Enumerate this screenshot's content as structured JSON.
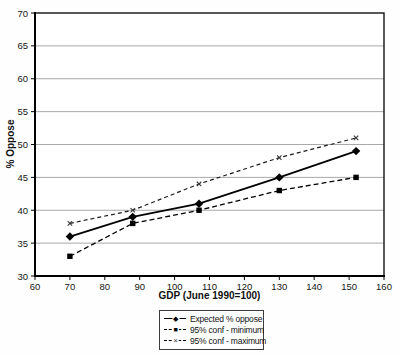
{
  "chart_data": {
    "type": "line",
    "title": "",
    "xlabel": "GDP (June 1990=100)",
    "ylabel": "% Oppose",
    "xlim": [
      60,
      160
    ],
    "ylim": [
      30,
      70
    ],
    "xticks": [
      60,
      70,
      80,
      90,
      100,
      110,
      120,
      130,
      140,
      150,
      160
    ],
    "yticks": [
      30,
      35,
      40,
      45,
      50,
      55,
      60,
      65,
      70
    ],
    "grid": "horizontal",
    "legend_position": "bottom-center",
    "x": [
      70,
      88,
      107,
      130,
      152
    ],
    "series": [
      {
        "name": "Expected % oppose",
        "values": [
          36,
          39,
          41,
          45,
          49
        ],
        "line": "solid",
        "marker": "diamond"
      },
      {
        "name": "95% conf - minimum",
        "values": [
          33,
          38,
          40,
          43,
          45
        ],
        "line": "dashed",
        "marker": "square"
      },
      {
        "name": "95% conf - maximum",
        "values": [
          38,
          40,
          44,
          48,
          51
        ],
        "line": "dashed",
        "marker": "x"
      }
    ]
  },
  "colors": {
    "line": "#000000",
    "grid": "#a8a8a8",
    "background": "#ffffff",
    "text": "#161616"
  },
  "legend": {
    "marker_diamond": "◆",
    "marker_square": "■",
    "marker_x": "×"
  }
}
